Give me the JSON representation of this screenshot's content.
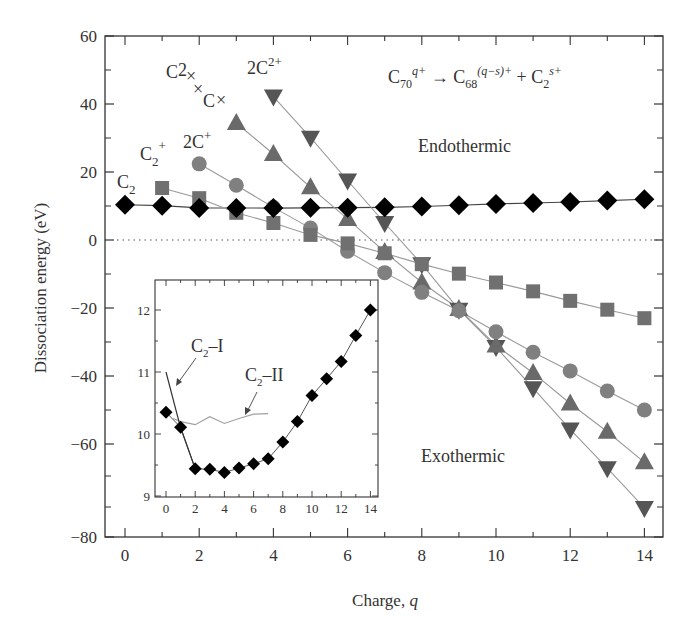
{
  "chart_data": [
    {
      "type": "scatter",
      "title": "",
      "equation": "C70^{q+} → C68^{(q−s)+} + C2^{s+}",
      "xlabel": "Charge, q",
      "ylabel": "Dissociation energy (eV)",
      "xlim": [
        0,
        14
      ],
      "ylim": [
        -80,
        60
      ],
      "xticks": [
        0,
        2,
        4,
        6,
        8,
        10,
        12,
        14
      ],
      "yticks": [
        60,
        40,
        20,
        0,
        -20,
        -40,
        -60,
        -80
      ],
      "grid": false,
      "reference_line": {
        "y": 0,
        "style": "dotted"
      },
      "annotations": [
        "Endothermic",
        "Exothermic"
      ],
      "series": [
        {
          "name": "C2",
          "marker": "diamond",
          "color": "#000000",
          "x": [
            0,
            1,
            2,
            3,
            4,
            5,
            6,
            7,
            8,
            9,
            10,
            11,
            12,
            13,
            14
          ],
          "values": [
            10.35,
            10.11,
            9.44,
            9.43,
            9.38,
            9.45,
            9.52,
            9.6,
            9.87,
            10.2,
            10.62,
            10.89,
            11.17,
            11.59,
            12.0
          ]
        },
        {
          "name": "C2+",
          "marker": "square",
          "color": "#707070",
          "x": [
            1,
            2,
            3,
            4,
            5,
            6,
            7,
            8,
            9,
            10,
            11,
            12,
            13,
            14
          ],
          "values": [
            15.3,
            12.3,
            8.0,
            5.0,
            1.5,
            -1.0,
            -3.9,
            -7.1,
            -9.9,
            -12.5,
            -15.1,
            -17.9,
            -20.5,
            -23.0
          ]
        },
        {
          "name": "2C+",
          "marker": "circle",
          "color": "#808080",
          "x": [
            2,
            3,
            4,
            5,
            6,
            7,
            8,
            9,
            10,
            11,
            12,
            13,
            14
          ],
          "values": [
            22.4,
            16.1,
            9.6,
            3.5,
            -3.3,
            -9.6,
            -15.4,
            -20.8,
            -27.0,
            -33.0,
            -38.5,
            -44.4,
            -50.0
          ]
        },
        {
          "name": "C2+ + C+",
          "marker": "triangle-up",
          "color": "#6a6a6a",
          "x": [
            3,
            4,
            5,
            6,
            7,
            8,
            9,
            10,
            11,
            12,
            13,
            14
          ],
          "values": [
            34.4,
            25.3,
            15.5,
            6.2,
            -3.5,
            -12.5,
            -20.3,
            -31.0,
            -39.1,
            -48.1,
            -56.4,
            -65.4
          ]
        },
        {
          "name": "2C2+",
          "marker": "triangle-down",
          "color": "#555555",
          "x": [
            4,
            5,
            6,
            7,
            8,
            9,
            10,
            11,
            12,
            13,
            14
          ],
          "values": [
            42.2,
            30.1,
            17.5,
            5.0,
            -7.1,
            -20.5,
            -31.5,
            -43.6,
            -55.7,
            -67.1,
            -78.8
          ]
        }
      ],
      "series_labels": [
        {
          "text": "C",
          "sub": "2",
          "sup": "",
          "x": 117,
          "y": 188
        },
        {
          "text": "C",
          "sub": "2",
          "sup": "+",
          "x": 140,
          "y": 160
        },
        {
          "text": "2C",
          "sub": "",
          "sup": "+",
          "x": 183,
          "y": 148
        },
        {
          "text": "C2× ×C×",
          "sub": "",
          "sup": "",
          "x": 165,
          "y": 75
        },
        {
          "text": "2C",
          "sub": "",
          "sup": "2+",
          "x": 247,
          "y": 74
        }
      ]
    },
    {
      "type": "line",
      "title": "inset",
      "xlabel": "",
      "ylabel": "",
      "xlim": [
        0,
        14
      ],
      "ylim": [
        9,
        12.2
      ],
      "xticks": [
        0,
        2,
        4,
        6,
        8,
        10,
        12,
        14
      ],
      "yticks": [
        9,
        10,
        11,
        12
      ],
      "series": [
        {
          "name": "C2 (diamonds)",
          "marker": "diamond",
          "x": [
            0,
            1,
            2,
            3,
            4,
            5,
            6,
            7,
            8,
            9,
            10,
            11,
            12,
            13,
            14
          ],
          "values": [
            10.35,
            10.11,
            9.44,
            9.43,
            9.38,
            9.45,
            9.52,
            9.6,
            9.87,
            10.2,
            10.62,
            10.89,
            11.17,
            11.59,
            12.0
          ]
        },
        {
          "name": "C2-I",
          "marker": "none",
          "color": "#333333",
          "x": [
            0,
            1,
            2
          ],
          "values": [
            11.0,
            10.1,
            9.44
          ]
        },
        {
          "name": "C2-II",
          "marker": "none",
          "color": "#999999",
          "x": [
            0.5,
            1,
            2,
            3,
            4,
            5,
            6,
            7
          ],
          "values": [
            10.25,
            10.2,
            10.15,
            10.28,
            10.17,
            10.25,
            10.32,
            10.33
          ]
        }
      ],
      "annotations": [
        "C2–I",
        "C2–II"
      ]
    }
  ],
  "labels": {
    "ylabel": "Dissociation energy (eV)",
    "xlabel_main": "Charge, ",
    "xlabel_var": "q",
    "endothermic": "Endothermic",
    "exothermic": "Exothermic",
    "inset_c2_i": "–I",
    "inset_c2_ii": "–II"
  }
}
